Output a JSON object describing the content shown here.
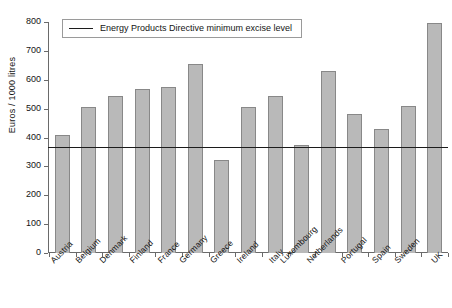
{
  "chart_data": {
    "type": "bar",
    "title": "",
    "xlabel": "",
    "ylabel": "Euros / 1000 litres",
    "ylim": [
      0,
      800
    ],
    "ytick_step": 100,
    "yticks": [
      800,
      700,
      600,
      500,
      400,
      300,
      200,
      100,
      0
    ],
    "grid": false,
    "legend_position": "top-left",
    "categories": [
      "Austria",
      "Belgium",
      "Denmark",
      "Finland",
      "France",
      "Germany",
      "Greece",
      "Ireland",
      "Italy",
      "Luxembourg",
      "Netherlands",
      "Portugal",
      "Spain",
      "Sweden",
      "UK"
    ],
    "values": [
      407,
      505,
      543,
      568,
      576,
      655,
      322,
      505,
      543,
      375,
      629,
      483,
      428,
      508,
      797
    ],
    "series": [
      {
        "name": "Excise level",
        "values": [
          407,
          505,
          543,
          568,
          576,
          655,
          322,
          505,
          543,
          375,
          629,
          483,
          428,
          508,
          797
        ]
      }
    ],
    "annotations": [
      {
        "type": "hline",
        "label": "Energy Products Directive minimum excise level",
        "value": 368,
        "color": "#1c1c1c"
      }
    ],
    "legend": [
      {
        "label": "Energy Products Directive minimum excise level",
        "marker": "line",
        "color": "#1c1c1c"
      }
    ],
    "colors": {
      "bar_fill": "#b9b9b9",
      "bar_edge": "#888888",
      "axis": "#6a6a6a",
      "threshold": "#1c1c1c"
    }
  }
}
